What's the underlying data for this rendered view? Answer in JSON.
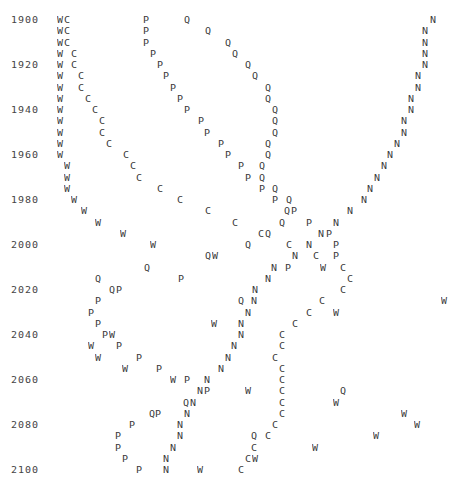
{
  "chart_data": {
    "type": "scatter",
    "title": "",
    "xlabel": "",
    "ylabel": "",
    "y_axis": "year",
    "y_tick_labels": [
      "1900",
      "1920",
      "1940",
      "1960",
      "1980",
      "2000",
      "2020",
      "2040",
      "2060",
      "2080",
      "2100"
    ],
    "y_step_years": 5,
    "series_symbols": [
      "W",
      "C",
      "P",
      "Q",
      "N"
    ],
    "rows": [
      {
        "year": 1900,
        "label": "1900",
        "glyphs": [
          [
            "W",
            57
          ],
          [
            "C",
            64
          ],
          [
            "P",
            143
          ],
          [
            "Q",
            184
          ],
          [
            "N",
            430
          ]
        ]
      },
      {
        "year": 1905,
        "label": "",
        "glyphs": [
          [
            "W",
            57
          ],
          [
            "C",
            64
          ],
          [
            "P",
            143
          ],
          [
            "Q",
            205
          ],
          [
            "N",
            422
          ]
        ]
      },
      {
        "year": 1910,
        "label": "",
        "glyphs": [
          [
            "W",
            57
          ],
          [
            "C",
            64
          ],
          [
            "P",
            143
          ],
          [
            "Q",
            225
          ],
          [
            "N",
            422
          ]
        ]
      },
      {
        "year": 1915,
        "label": "",
        "glyphs": [
          [
            "W",
            57
          ],
          [
            "C",
            71
          ],
          [
            "P",
            150
          ],
          [
            "Q",
            232
          ],
          [
            "N",
            422
          ]
        ]
      },
      {
        "year": 1920,
        "label": "1920",
        "glyphs": [
          [
            "W",
            57
          ],
          [
            "C",
            71
          ],
          [
            "P",
            157
          ],
          [
            "Q",
            245
          ],
          [
            "N",
            422
          ]
        ]
      },
      {
        "year": 1925,
        "label": "",
        "glyphs": [
          [
            "W",
            57
          ],
          [
            "C",
            78
          ],
          [
            "P",
            163
          ],
          [
            "Q",
            252
          ],
          [
            "N",
            415
          ]
        ]
      },
      {
        "year": 1930,
        "label": "",
        "glyphs": [
          [
            "W",
            57
          ],
          [
            "C",
            78
          ],
          [
            "P",
            170
          ],
          [
            "Q",
            265
          ],
          [
            "N",
            415
          ]
        ]
      },
      {
        "year": 1935,
        "label": "",
        "glyphs": [
          [
            "W",
            57
          ],
          [
            "C",
            85
          ],
          [
            "P",
            177
          ],
          [
            "Q",
            265
          ],
          [
            "N",
            408
          ]
        ]
      },
      {
        "year": 1940,
        "label": "1940",
        "glyphs": [
          [
            "W",
            57
          ],
          [
            "C",
            92
          ],
          [
            "P",
            184
          ],
          [
            "Q",
            272
          ],
          [
            "N",
            408
          ]
        ]
      },
      {
        "year": 1945,
        "label": "",
        "glyphs": [
          [
            "W",
            57
          ],
          [
            "C",
            99
          ],
          [
            "P",
            198
          ],
          [
            "Q",
            272
          ],
          [
            "N",
            401
          ]
        ]
      },
      {
        "year": 1950,
        "label": "",
        "glyphs": [
          [
            "W",
            57
          ],
          [
            "C",
            99
          ],
          [
            "P",
            204
          ],
          [
            "Q",
            272
          ],
          [
            "N",
            401
          ]
        ]
      },
      {
        "year": 1955,
        "label": "",
        "glyphs": [
          [
            "W",
            57
          ],
          [
            "C",
            106
          ],
          [
            "P",
            218
          ],
          [
            "Q",
            265
          ],
          [
            "N",
            394
          ]
        ]
      },
      {
        "year": 1960,
        "label": "1960",
        "glyphs": [
          [
            "W",
            57
          ],
          [
            "C",
            123
          ],
          [
            "P",
            225
          ],
          [
            "Q",
            265
          ],
          [
            "N",
            387
          ]
        ]
      },
      {
        "year": 1965,
        "label": "",
        "glyphs": [
          [
            "W",
            64
          ],
          [
            "C",
            130
          ],
          [
            "P",
            238
          ],
          [
            "Q",
            259
          ],
          [
            "N",
            381
          ]
        ]
      },
      {
        "year": 1970,
        "label": "",
        "glyphs": [
          [
            "W",
            64
          ],
          [
            "C",
            136
          ],
          [
            "P",
            245
          ],
          [
            "Q",
            259
          ],
          [
            "N",
            374
          ]
        ]
      },
      {
        "year": 1975,
        "label": "",
        "glyphs": [
          [
            "W",
            64
          ],
          [
            "C",
            157
          ],
          [
            "P",
            259
          ],
          [
            "Q",
            272
          ],
          [
            "N",
            367
          ]
        ]
      },
      {
        "year": 1980,
        "label": "1980",
        "glyphs": [
          [
            "W",
            71
          ],
          [
            "C",
            177
          ],
          [
            "P",
            272
          ],
          [
            "Q",
            286
          ],
          [
            "N",
            361
          ]
        ]
      },
      {
        "year": 1985,
        "label": "",
        "glyphs": [
          [
            "W",
            81
          ],
          [
            "C",
            205
          ],
          [
            "Q",
            284
          ],
          [
            "P",
            291
          ],
          [
            "N",
            347
          ]
        ]
      },
      {
        "year": 1990,
        "label": "",
        "glyphs": [
          [
            "W",
            95
          ],
          [
            "C",
            232
          ],
          [
            "Q",
            279
          ],
          [
            "P",
            306
          ],
          [
            "N",
            333
          ]
        ]
      },
      {
        "year": 1995,
        "label": "",
        "glyphs": [
          [
            "W",
            120
          ],
          [
            "C",
            258
          ],
          [
            "Q",
            265
          ],
          [
            "N",
            318
          ],
          [
            "P",
            326
          ]
        ]
      },
      {
        "year": 2000,
        "label": "2000",
        "glyphs": [
          [
            "W",
            150
          ],
          [
            "Q",
            245
          ],
          [
            "C",
            286
          ],
          [
            "N",
            306
          ],
          [
            "P",
            333
          ]
        ]
      },
      {
        "year": 2005,
        "label": "",
        "glyphs": [
          [
            "Q",
            205
          ],
          [
            "W",
            212
          ],
          [
            "N",
            292
          ],
          [
            "C",
            313
          ],
          [
            "P",
            333
          ]
        ]
      },
      {
        "year": 2010,
        "label": "",
        "glyphs": [
          [
            "Q",
            144
          ],
          [
            "N",
            271
          ],
          [
            "P",
            285
          ],
          [
            "W",
            320
          ],
          [
            "C",
            340
          ]
        ]
      },
      {
        "year": 2015,
        "label": "",
        "glyphs": [
          [
            "Q",
            95
          ],
          [
            "P",
            178
          ],
          [
            "N",
            265
          ],
          [
            "C",
            347
          ]
        ]
      },
      {
        "year": 2020,
        "label": "2020",
        "glyphs": [
          [
            "Q",
            109
          ],
          [
            "P",
            116
          ],
          [
            "N",
            252
          ],
          [
            "C",
            340
          ]
        ]
      },
      {
        "year": 2025,
        "label": "",
        "glyphs": [
          [
            "P",
            95
          ],
          [
            "Q",
            238
          ],
          [
            "N",
            251
          ],
          [
            "C",
            319
          ],
          [
            "W",
            441
          ]
        ]
      },
      {
        "year": 2030,
        "label": "",
        "glyphs": [
          [
            "P",
            88
          ],
          [
            "N",
            245
          ],
          [
            "C",
            306
          ],
          [
            "W",
            333
          ]
        ]
      },
      {
        "year": 2035,
        "label": "",
        "glyphs": [
          [
            "P",
            95
          ],
          [
            "W",
            211
          ],
          [
            "N",
            238
          ],
          [
            "C",
            292
          ]
        ]
      },
      {
        "year": 2040,
        "label": "2040",
        "glyphs": [
          [
            "P",
            102
          ],
          [
            "W",
            109
          ],
          [
            "N",
            238
          ],
          [
            "C",
            279
          ]
        ]
      },
      {
        "year": 2045,
        "label": "",
        "glyphs": [
          [
            "W",
            88
          ],
          [
            "P",
            116
          ],
          [
            "N",
            231
          ],
          [
            "C",
            279
          ]
        ]
      },
      {
        "year": 2050,
        "label": "",
        "glyphs": [
          [
            "W",
            95
          ],
          [
            "P",
            136
          ],
          [
            "N",
            225
          ],
          [
            "C",
            272
          ]
        ]
      },
      {
        "year": 2055,
        "label": "",
        "glyphs": [
          [
            "W",
            122
          ],
          [
            "P",
            156
          ],
          [
            "N",
            218
          ],
          [
            "C",
            279
          ]
        ]
      },
      {
        "year": 2060,
        "label": "2060",
        "glyphs": [
          [
            "W",
            170
          ],
          [
            "P",
            184
          ],
          [
            "N",
            204
          ],
          [
            "C",
            279
          ]
        ]
      },
      {
        "year": 2065,
        "label": "",
        "glyphs": [
          [
            "N",
            197
          ],
          [
            "P",
            204
          ],
          [
            "W",
            245
          ],
          [
            "C",
            279
          ],
          [
            "Q",
            340
          ]
        ]
      },
      {
        "year": 2070,
        "label": "",
        "glyphs": [
          [
            "Q",
            183
          ],
          [
            "N",
            190
          ],
          [
            "C",
            279
          ],
          [
            "W",
            333
          ]
        ]
      },
      {
        "year": 2075,
        "label": "",
        "glyphs": [
          [
            "Q",
            149
          ],
          [
            "P",
            155
          ],
          [
            "N",
            184
          ],
          [
            "C",
            279
          ],
          [
            "W",
            401
          ]
        ]
      },
      {
        "year": 2080,
        "label": "2080",
        "glyphs": [
          [
            "P",
            129
          ],
          [
            "N",
            177
          ],
          [
            "C",
            272
          ],
          [
            "W",
            414
          ]
        ]
      },
      {
        "year": 2085,
        "label": "",
        "glyphs": [
          [
            "P",
            115
          ],
          [
            "N",
            177
          ],
          [
            "Q",
            251
          ],
          [
            "C",
            265
          ],
          [
            "W",
            373
          ]
        ]
      },
      {
        "year": 2090,
        "label": "",
        "glyphs": [
          [
            "P",
            115
          ],
          [
            "N",
            170
          ],
          [
            "C",
            251
          ],
          [
            "W",
            312
          ]
        ]
      },
      {
        "year": 2095,
        "label": "",
        "glyphs": [
          [
            "P",
            122
          ],
          [
            "N",
            163
          ],
          [
            "C",
            245
          ],
          [
            "W",
            252
          ]
        ]
      },
      {
        "year": 2100,
        "label": "2100",
        "glyphs": [
          [
            "P",
            136
          ],
          [
            "N",
            163
          ],
          [
            "W",
            197
          ],
          [
            "C",
            238
          ]
        ]
      }
    ],
    "layout": {
      "label_x": 11,
      "first_row_y": 15,
      "row_height": 11.25,
      "grid": false,
      "legend": "none"
    }
  }
}
